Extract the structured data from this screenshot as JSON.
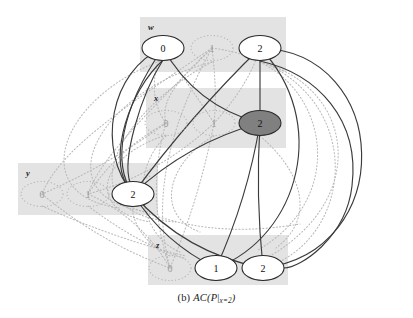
{
  "figure": {
    "caption_prefix": "(b)",
    "caption_main": "AC(P",
    "caption_bar": "|",
    "caption_sub": "x=2",
    "caption_close": ")",
    "caption_full": "(b) AC(P|x=2)",
    "background_color": "#ffffff",
    "domain_box_color": "#e3e3e3",
    "node_fill_color": "#ffffff",
    "node_selected_fill_color": "#808080",
    "node_stroke_color": "#2b2b2b",
    "solid_edge_color": "#3a3a3a",
    "dotted_edge_color": "#b4b4b4"
  },
  "variables": [
    {
      "name": "w",
      "label": "w",
      "box": {
        "x": 140,
        "y": 17,
        "w": 146,
        "h": 55
      },
      "values": [
        {
          "value": "0",
          "x": 163,
          "y": 48,
          "state": "alive"
        },
        {
          "value": "1",
          "x": 212,
          "y": 48,
          "state": "pruned"
        },
        {
          "value": "2",
          "x": 260,
          "y": 48,
          "state": "alive"
        }
      ]
    },
    {
      "name": "x",
      "label": "x",
      "box": {
        "x": 146,
        "y": 88,
        "w": 140,
        "h": 60
      },
      "values": [
        {
          "value": "0",
          "x": 166,
          "y": 123,
          "state": "pruned"
        },
        {
          "value": "1",
          "x": 214,
          "y": 123,
          "state": "pruned"
        },
        {
          "value": "2",
          "x": 260,
          "y": 123,
          "state": "selected"
        }
      ]
    },
    {
      "name": "y",
      "label": "y",
      "box": {
        "x": 18,
        "y": 163,
        "w": 140,
        "h": 52
      },
      "values": [
        {
          "value": "0",
          "x": 42,
          "y": 194,
          "state": "pruned"
        },
        {
          "value": "1",
          "x": 88,
          "y": 194,
          "state": "pruned"
        },
        {
          "value": "2",
          "x": 133,
          "y": 194,
          "state": "alive"
        }
      ]
    },
    {
      "name": "z",
      "label": "z",
      "box": {
        "x": 148,
        "y": 235,
        "w": 140,
        "h": 50
      },
      "values": [
        {
          "value": "0",
          "x": 170,
          "y": 268,
          "state": "pruned"
        },
        {
          "value": "1",
          "x": 216,
          "y": 268,
          "state": "alive"
        },
        {
          "value": "2",
          "x": 263,
          "y": 268,
          "state": "alive"
        }
      ]
    }
  ],
  "chart_data": {
    "type": "diagram",
    "title": "(b) AC(P|x=2)",
    "node_states": {
      "alive": "supported value, solid white ellipse",
      "pruned": "removed value, dotted grey ellipse",
      "selected": "assigned value, filled grey ellipse"
    },
    "solid_edges": [
      [
        "w.0",
        "y.2"
      ],
      [
        "w.0",
        "x.2"
      ],
      [
        "w.2",
        "x.2"
      ],
      [
        "w.2",
        "z.2"
      ],
      [
        "w.2",
        "z.1"
      ],
      [
        "x.2",
        "y.2"
      ],
      [
        "x.2",
        "z.1"
      ],
      [
        "x.2",
        "z.2"
      ],
      [
        "y.2",
        "z.1"
      ],
      [
        "y.2",
        "z.2"
      ],
      [
        "y.2",
        "w.0"
      ],
      [
        "y.2",
        "w.2"
      ]
    ],
    "dotted_edges": [
      [
        "w.1",
        "x.0"
      ],
      [
        "w.1",
        "x.1"
      ],
      [
        "w.1",
        "y.0"
      ],
      [
        "w.1",
        "y.1"
      ],
      [
        "w.1",
        "z.0"
      ],
      [
        "w.0",
        "x.0"
      ],
      [
        "w.0",
        "x.1"
      ],
      [
        "w.2",
        "x.1"
      ],
      [
        "x.0",
        "y.0"
      ],
      [
        "x.0",
        "y.1"
      ],
      [
        "x.1",
        "y.1"
      ],
      [
        "x.0",
        "z.0"
      ],
      [
        "x.1",
        "z.0"
      ],
      [
        "y.0",
        "z.0"
      ],
      [
        "y.1",
        "z.0"
      ],
      [
        "w.1",
        "z.2"
      ]
    ]
  }
}
